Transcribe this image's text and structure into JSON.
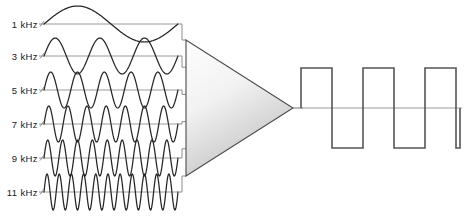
{
  "diagram": {
    "colors": {
      "background": "#ffffff",
      "wave_stroke": "#262626",
      "axis_stroke": "#9a9a9a",
      "lead_stroke": "#8c8c8c",
      "triangle_stroke": "#4a4a4a",
      "triangle_fill_light": "#fdfdfd",
      "triangle_fill_dark": "#bdbdbd",
      "square_stroke": "#555555",
      "label_color": "#1a1a1a"
    },
    "inputs": {
      "label_suffix": "kHz",
      "channels": [
        {
          "label": "1  kHz",
          "freq_khz": 1,
          "cycles": 1,
          "baseline_y": 24,
          "amplitude": 18
        },
        {
          "label": "3  kHz",
          "freq_khz": 3,
          "cycles": 3,
          "baseline_y": 56,
          "amplitude": 18
        },
        {
          "label": "5  kHz",
          "freq_khz": 5,
          "cycles": 5,
          "baseline_y": 90,
          "amplitude": 18
        },
        {
          "label": "7  kHz",
          "freq_khz": 7,
          "cycles": 7,
          "baseline_y": 124,
          "amplitude": 18
        },
        {
          "label": "9  kHz",
          "freq_khz": 9,
          "cycles": 9,
          "baseline_y": 158,
          "amplitude": 18
        },
        {
          "label": "11  kHz",
          "freq_khz": 11,
          "cycles": 11,
          "baseline_y": 192,
          "amplitude": 18
        }
      ],
      "wave_x_start": 44,
      "wave_x_end": 178
    },
    "amplifier": {
      "name": "summing-amplifier",
      "apex_x": 293,
      "apex_y": 108,
      "left_x": 186,
      "top_y": 40,
      "bottom_y": 176
    },
    "output": {
      "name": "square-wave-output",
      "baseline_y": 108,
      "x_start": 301,
      "x_end": 460,
      "high_y": 68,
      "low_y": 148,
      "period": 62,
      "description": "square wave"
    }
  },
  "chart_data": {
    "type": "line",
    "xlabel": "",
    "ylabel": "",
    "legend_position": "left",
    "series": [
      {
        "name": "1  kHz",
        "cycles": 1,
        "amplitude": 1.0,
        "waveform": "sine"
      },
      {
        "name": "3  kHz",
        "cycles": 3,
        "amplitude": 1.0,
        "waveform": "sine"
      },
      {
        "name": "5  kHz",
        "cycles": 5,
        "amplitude": 1.0,
        "waveform": "sine"
      },
      {
        "name": "7  kHz",
        "cycles": 7,
        "amplitude": 1.0,
        "waveform": "sine"
      },
      {
        "name": "9  kHz",
        "cycles": 9,
        "amplitude": 1.0,
        "waveform": "sine"
      },
      {
        "name": "11  kHz",
        "cycles": 11,
        "amplitude": 1.0,
        "waveform": "sine"
      }
    ],
    "result": {
      "name": "output",
      "cycles": 2.6,
      "waveform": "square",
      "amplitude": 1.0
    }
  }
}
